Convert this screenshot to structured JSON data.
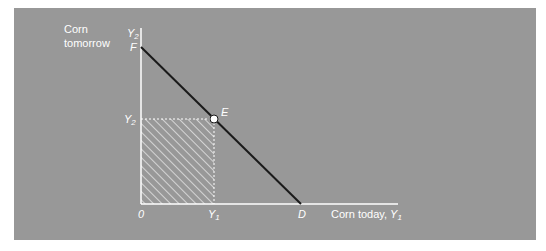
{
  "figure": {
    "top_fragment_text": "",
    "y_axis_title_line1": "Corn",
    "y_axis_title_line2": "tomorrow",
    "y_axis_symbol": "Y",
    "y_axis_symbol_sub": "2",
    "x_axis_title": "Corn today, ",
    "x_axis_symbol": "Y",
    "x_axis_symbol_sub": "1",
    "origin_label": "0",
    "intercept_y_label": "F",
    "intercept_x_label": "D",
    "point_label": "E",
    "tick_y_label": "Y",
    "tick_y_label_sub": "2",
    "tick_x_label": "Y",
    "tick_x_label_sub": "1"
  },
  "colors": {
    "panel_bg": "#989898",
    "axis": "#ffffff",
    "budget_line": "#1a1a1a",
    "hatch": "#ffffff",
    "point_fill": "#ffffff"
  }
}
